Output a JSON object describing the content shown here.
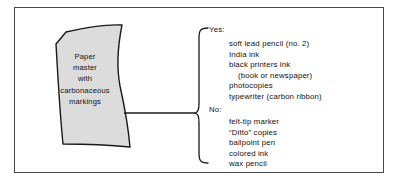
{
  "figure": {
    "name": "paper-master-suitability-diagram",
    "border_color": "#4a4a4a",
    "background": "#ffffff"
  },
  "paper": {
    "fill_color": "#dcdcdc",
    "stroke_color": "#1a1a1a",
    "lines": [
      "Paper",
      "master",
      "with",
      "carbonaceous",
      "markings"
    ]
  },
  "brace": {
    "stroke_color": "#1a1a1a",
    "connector_label": "leader-line"
  },
  "categories": [
    {
      "key": "yes",
      "label": "Yes:",
      "items": [
        {
          "text": "soft lead pencil (no. 2)",
          "indent": false
        },
        {
          "text": "India ink",
          "indent": false
        },
        {
          "text": "black printers ink",
          "indent": false
        },
        {
          "text": "(book or newspaper)",
          "indent": true
        },
        {
          "text": "photocopies",
          "indent": false
        },
        {
          "text": "typewriter (carbon ribbon)",
          "indent": false
        }
      ]
    },
    {
      "key": "no",
      "label": "No:",
      "items": [
        {
          "text": "felt-tip marker",
          "indent": false
        },
        {
          "text": "“Ditto” copies",
          "indent": false
        },
        {
          "text": "ballpoint pen",
          "indent": false
        },
        {
          "text": "colored ink",
          "indent": false
        },
        {
          "text": "wax pencil",
          "indent": false
        }
      ]
    }
  ]
}
